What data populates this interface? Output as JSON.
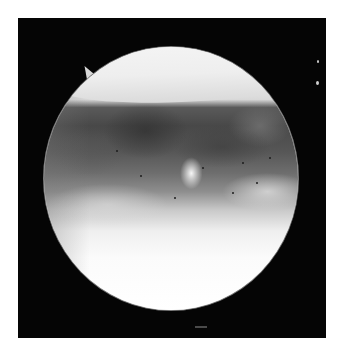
{
  "image": {
    "description": "Arthroscopic endoscope view: circular field inside a black square frame on white background",
    "frame_color": "#050505",
    "page_background": "#ffffff",
    "scope_view": {
      "shape": "ellipse",
      "regions": [
        {
          "name": "bright-cap",
          "tone": "#f0f0f0"
        },
        {
          "name": "dark-tissue-band",
          "tone": "#484848"
        },
        {
          "name": "bright-lower-field",
          "tone": "#fbfbfb"
        }
      ],
      "rim_color": "#7a7a7a"
    },
    "instrument_tip_color": "#d8d8d8",
    "stray_dots_color": "#d0d0d0"
  }
}
